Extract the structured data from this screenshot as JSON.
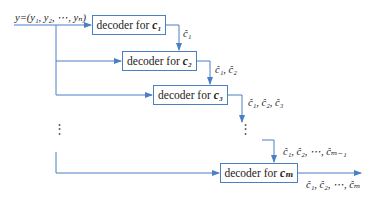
{
  "diagram": {
    "input_label": "y=(y₁, y₂, ⋯, yₙ)",
    "line_color": "#4a7fc4",
    "decoders": [
      {
        "prefix": "decoder for",
        "target": "c₁"
      },
      {
        "prefix": "decoder for",
        "target": "c₂"
      },
      {
        "prefix": "decoder for",
        "target": "c₃"
      },
      {
        "prefix": "decoder for",
        "target": "cₘ"
      }
    ],
    "edge_labels": [
      "ĉ₁",
      "ĉ₁, ĉ₂",
      "ĉ₁, ĉ₂, ĉ₃",
      "ĉ₁, ĉ₂, ⋯, ĉₘ₋₁",
      "ĉ₁, ĉ₂, ⋯, ĉₘ"
    ],
    "ellipsis": "⋮"
  }
}
